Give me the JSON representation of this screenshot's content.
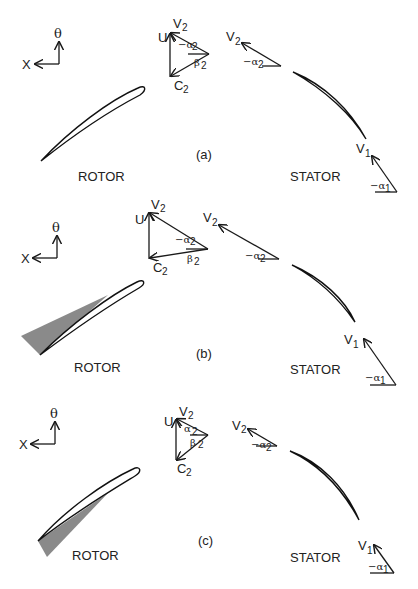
{
  "figure": {
    "panels": [
      {
        "id": "a",
        "caption": "(a)",
        "axes": {
          "x_label": "X",
          "theta_label": "θ"
        },
        "rotor": {
          "label": "ROTOR",
          "wake_shading": "none"
        },
        "stator": {
          "label": "STATOR"
        },
        "rotor_triangle": {
          "v_label": "V",
          "v_sub": "2",
          "u_label": "U",
          "c_label": "C",
          "c_sub": "2",
          "alpha_label": "−α",
          "alpha_sub": "2",
          "beta_label": "β",
          "beta_sub": "2"
        },
        "stator_inlet": {
          "v_label": "V",
          "v_sub": "2",
          "alpha_label": "−α",
          "alpha_sub": "2"
        },
        "stator_outlet": {
          "v_label": "V",
          "v_sub": "1",
          "alpha_label": "−α",
          "alpha_sub": "1"
        }
      },
      {
        "id": "b",
        "caption": "(b)",
        "axes": {
          "x_label": "X",
          "theta_label": "θ"
        },
        "rotor": {
          "label": "ROTOR",
          "wake_shading": "pressure-side"
        },
        "stator": {
          "label": "STATOR"
        },
        "rotor_triangle": {
          "v_label": "V",
          "v_sub": "2",
          "u_label": "U",
          "c_label": "C",
          "c_sub": "2",
          "alpha_label": "−α",
          "alpha_sub": "2",
          "beta_label": "β",
          "beta_sub": "2"
        },
        "stator_inlet": {
          "v_label": "V",
          "v_sub": "2",
          "alpha_label": "−α",
          "alpha_sub": "2"
        },
        "stator_outlet": {
          "v_label": "V",
          "v_sub": "1",
          "alpha_label": "−α",
          "alpha_sub": "1"
        }
      },
      {
        "id": "c",
        "caption": "(c)",
        "axes": {
          "x_label": "X",
          "theta_label": "θ"
        },
        "rotor": {
          "label": "ROTOR",
          "wake_shading": "suction-side"
        },
        "stator": {
          "label": "STATOR"
        },
        "rotor_triangle": {
          "v_label": "V",
          "v_sub": "2",
          "u_label": "U",
          "c_label": "C",
          "c_sub": "2",
          "alpha_label": "α",
          "alpha_sub": "2",
          "beta_label": "β",
          "beta_sub": "2"
        },
        "stator_inlet": {
          "v_label": "V",
          "v_sub": "2",
          "alpha_label": "−α",
          "alpha_sub": "2"
        },
        "stator_outlet": {
          "v_label": "V",
          "v_sub": "1",
          "alpha_label": "−α",
          "alpha_sub": "1"
        }
      }
    ],
    "colors": {
      "line": "#1a1a1a",
      "shade": "#8a8a8a",
      "background": "#ffffff"
    }
  }
}
